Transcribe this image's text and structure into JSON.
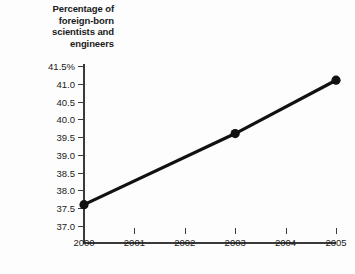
{
  "chart_data": {
    "type": "line",
    "title": "Percentage of foreign-born scientists and engineers",
    "title_lines": [
      "Percentage of",
      "foreign-born",
      "scientists and",
      "engineers"
    ],
    "xlabel": "",
    "ylabel": "",
    "x": [
      2000,
      2003,
      2005
    ],
    "values": [
      37.6,
      39.6,
      41.1
    ],
    "series": [
      {
        "name": "Percentage of foreign-born scientists and engineers",
        "values": [
          37.6,
          39.6,
          41.1
        ]
      }
    ],
    "xlim": [
      2000,
      2005
    ],
    "ylim": [
      37.0,
      41.5
    ],
    "x_ticks": [
      2000,
      2001,
      2002,
      2003,
      2004,
      2005
    ],
    "x_tick_labels": [
      "2000",
      "2001",
      "2002",
      "2003",
      "2004",
      "2005"
    ],
    "y_ticks": [
      41.5,
      41.0,
      40.5,
      40.0,
      39.5,
      39.0,
      38.5,
      38.0,
      37.5,
      37.0
    ],
    "y_tick_labels": [
      "41.5%",
      "41.0",
      "40.5",
      "40.0",
      "39.5",
      "39.0",
      "38.5",
      "38.0",
      "37.5",
      "37.0"
    ],
    "grid": false,
    "legend": false,
    "legend_position": "none",
    "line_color": "#111111",
    "marker": "circle",
    "marker_color": "#111111",
    "axis_color": "#3a3a3a",
    "background_color": "#fdfdfd"
  }
}
